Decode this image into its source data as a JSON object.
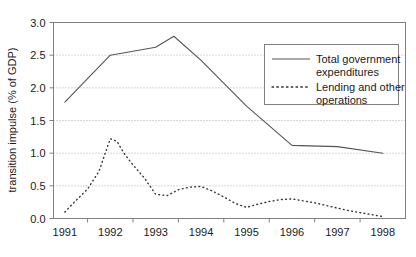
{
  "chart_data": {
    "type": "line",
    "title": "",
    "xlabel": "",
    "ylabel": "transition impulse (% of GDP)",
    "xlim": [
      1990.75,
      1998.5
    ],
    "ylim": [
      0.0,
      3.0
    ],
    "grid": true,
    "grid_axis": "y",
    "legend_position": "upper right",
    "y_ticks": [
      "0.0",
      "0.5",
      "1.0",
      "1.5",
      "2.0",
      "2.5",
      "3.0"
    ],
    "y_tick_values": [
      0.0,
      0.5,
      1.0,
      1.5,
      2.0,
      2.5,
      3.0
    ],
    "x_ticks": [
      "1991",
      "1992",
      "1993",
      "1994",
      "1995",
      "1996",
      "1997",
      "1998"
    ],
    "x_tick_values": [
      1991,
      1992,
      1993,
      1994,
      1995,
      1996,
      1997,
      1998
    ],
    "series": [
      {
        "name": "Total government expenditures",
        "style": "solid",
        "color": "#555555",
        "x": [
          1991.0,
          1992.0,
          1993.0,
          1993.4,
          1994.0,
          1995.0,
          1996.0,
          1997.0,
          1998.0
        ],
        "values": [
          1.78,
          2.5,
          2.62,
          2.79,
          2.42,
          1.72,
          1.12,
          1.1,
          1.0
        ]
      },
      {
        "name": "Lending and other operations",
        "style": "dotted",
        "color": "#333333",
        "x": [
          1991.0,
          1991.25,
          1991.5,
          1991.75,
          1992.0,
          1992.15,
          1992.3,
          1992.5,
          1992.75,
          1993.0,
          1993.25,
          1993.5,
          1993.75,
          1994.0,
          1994.25,
          1994.5,
          1994.75,
          1995.0,
          1995.25,
          1995.5,
          1995.75,
          1996.0,
          1996.25,
          1996.5,
          1996.75,
          1997.0,
          1997.25,
          1997.5,
          1997.75,
          1998.0
        ],
        "values": [
          0.1,
          0.28,
          0.45,
          0.72,
          1.22,
          1.18,
          1.0,
          0.82,
          0.62,
          0.37,
          0.35,
          0.44,
          0.48,
          0.49,
          0.42,
          0.33,
          0.23,
          0.17,
          0.22,
          0.26,
          0.29,
          0.3,
          0.27,
          0.24,
          0.2,
          0.16,
          0.12,
          0.09,
          0.06,
          0.03
        ]
      }
    ],
    "legend": [
      {
        "label_line1": "Total government",
        "label_line2": "expenditures",
        "style": "solid"
      },
      {
        "label_line1": "Lending and other",
        "label_line2": "operations",
        "style": "dotted"
      }
    ]
  },
  "colors": {
    "plot_border": "#808080",
    "gridline": "#b0b0b0",
    "axis_text": "#1a1a1a",
    "legend_border": "#808080",
    "series_solid": "#555555",
    "series_dotted": "#333333",
    "background": "#ffffff"
  }
}
